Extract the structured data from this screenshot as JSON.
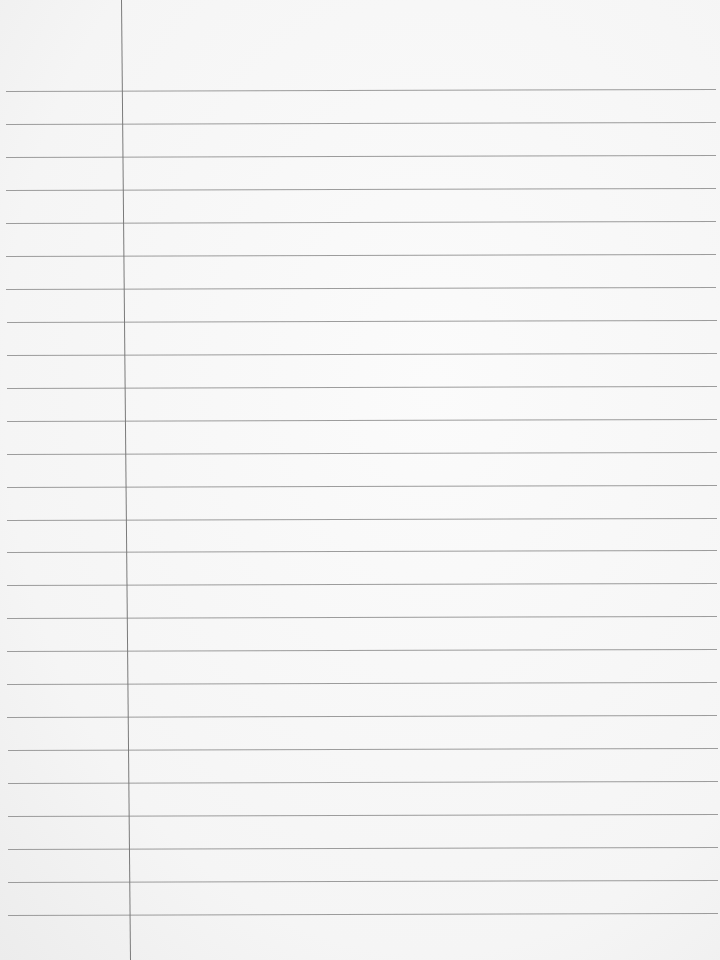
{
  "paper": {
    "type": "lined notebook paper",
    "background_color": "#f6f6f6",
    "rule_color": "#8c8c8c",
    "margin_line_color": "#7a7a7a",
    "rules": {
      "count": 26,
      "first_y": 90,
      "spacing": 32.96,
      "x_start": 6,
      "x_end": 716
    },
    "margin_line": {
      "x_top": 121,
      "x_bottom": 130
    }
  }
}
